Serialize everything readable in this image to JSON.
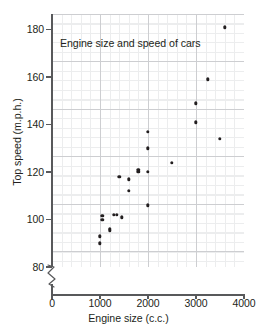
{
  "chart_data": {
    "type": "scatter",
    "title": "Engine size and speed of cars",
    "xlabel": "Engine size (c.c.)",
    "ylabel": "Top speed (m.p.h.)",
    "xlim": [
      0,
      4000
    ],
    "ylim": [
      78,
      186
    ],
    "y_axis_break": true,
    "y_axis_break_note": "axis broken between 0 and 80",
    "grid": "major and minor gridlines shown",
    "legend": "none",
    "marker_color": "#231f20",
    "xticks": [
      0,
      1000,
      2000,
      3000,
      4000
    ],
    "xtick_labels": [
      "0",
      "1000",
      "2000",
      "3000",
      "4000"
    ],
    "yticks": [
      80,
      100,
      120,
      140,
      160,
      180
    ],
    "ytick_labels": [
      "80",
      "100",
      "120",
      "140",
      "160",
      "180"
    ],
    "points": [
      {
        "x": 1000,
        "y": 90
      },
      {
        "x": 1000,
        "y": 93
      },
      {
        "x": 1050,
        "y": 100
      },
      {
        "x": 1050,
        "y": 101.5
      },
      {
        "x": 1200,
        "y": 95.5
      },
      {
        "x": 1200,
        "y": 96
      },
      {
        "x": 1290,
        "y": 102
      },
      {
        "x": 1350,
        "y": 102
      },
      {
        "x": 1400,
        "y": 118
      },
      {
        "x": 1450,
        "y": 101
      },
      {
        "x": 1600,
        "y": 117
      },
      {
        "x": 1600,
        "y": 112
      },
      {
        "x": 1800,
        "y": 120
      },
      {
        "x": 1800,
        "y": 121
      },
      {
        "x": 2000,
        "y": 137
      },
      {
        "x": 2000,
        "y": 130
      },
      {
        "x": 2000,
        "y": 120
      },
      {
        "x": 2000,
        "y": 106
      },
      {
        "x": 2500,
        "y": 124
      },
      {
        "x": 3000,
        "y": 149
      },
      {
        "x": 3000,
        "y": 141
      },
      {
        "x": 3250,
        "y": 159
      },
      {
        "x": 3500,
        "y": 134
      },
      {
        "x": 3600,
        "y": 181
      }
    ]
  }
}
